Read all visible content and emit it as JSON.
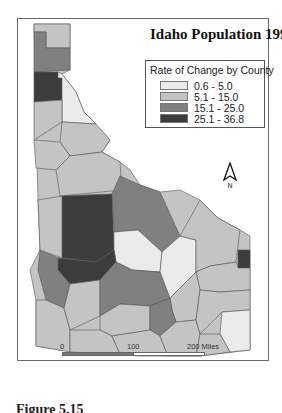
{
  "map": {
    "title": "Idaho Population 1990-95",
    "legend": {
      "title": "Rate of Change by County",
      "classes": [
        {
          "label": "0.6 - 5.0",
          "color": "#ebebeb"
        },
        {
          "label": "5.1 - 15.0",
          "color": "#c4c4c4"
        },
        {
          "label": "15.1 - 25.0",
          "color": "#808080"
        },
        {
          "label": "25.1 - 36.8",
          "color": "#3c3c3c"
        }
      ]
    },
    "north_arrow": {
      "label": "N"
    },
    "scale_bar": {
      "ticks": [
        "0",
        "100",
        "200 Miles"
      ]
    },
    "county_classes": {
      "boundary": 1,
      "panhandle_top": 1,
      "panhandle_mid": 2,
      "kootenai": 3,
      "shoshone": 0,
      "benewah_latah": 1,
      "clearwater": 1,
      "nezperce_lewis": 1,
      "idaho_north": 1,
      "valley_adams": 3,
      "lemhi": 2,
      "custer": 0,
      "ada_boise": 3,
      "canyon_payette": 2,
      "washington": 1,
      "owyhee": 1,
      "elmore": 1,
      "camas_blaine": 2,
      "butte_clark": 0,
      "fremont_madison": 1,
      "teton": 3,
      "bonneville": 1,
      "bingham": 1,
      "gooding_lincoln": 1,
      "jerome_minidoka": 2,
      "twinfalls": 1,
      "cassia": 1,
      "power_bannock": 1,
      "caribou": 1,
      "bear_lake": 0,
      "oneida_franklin": 1,
      "bonneville_east": 0
    }
  },
  "caption": "Figure 5.15"
}
